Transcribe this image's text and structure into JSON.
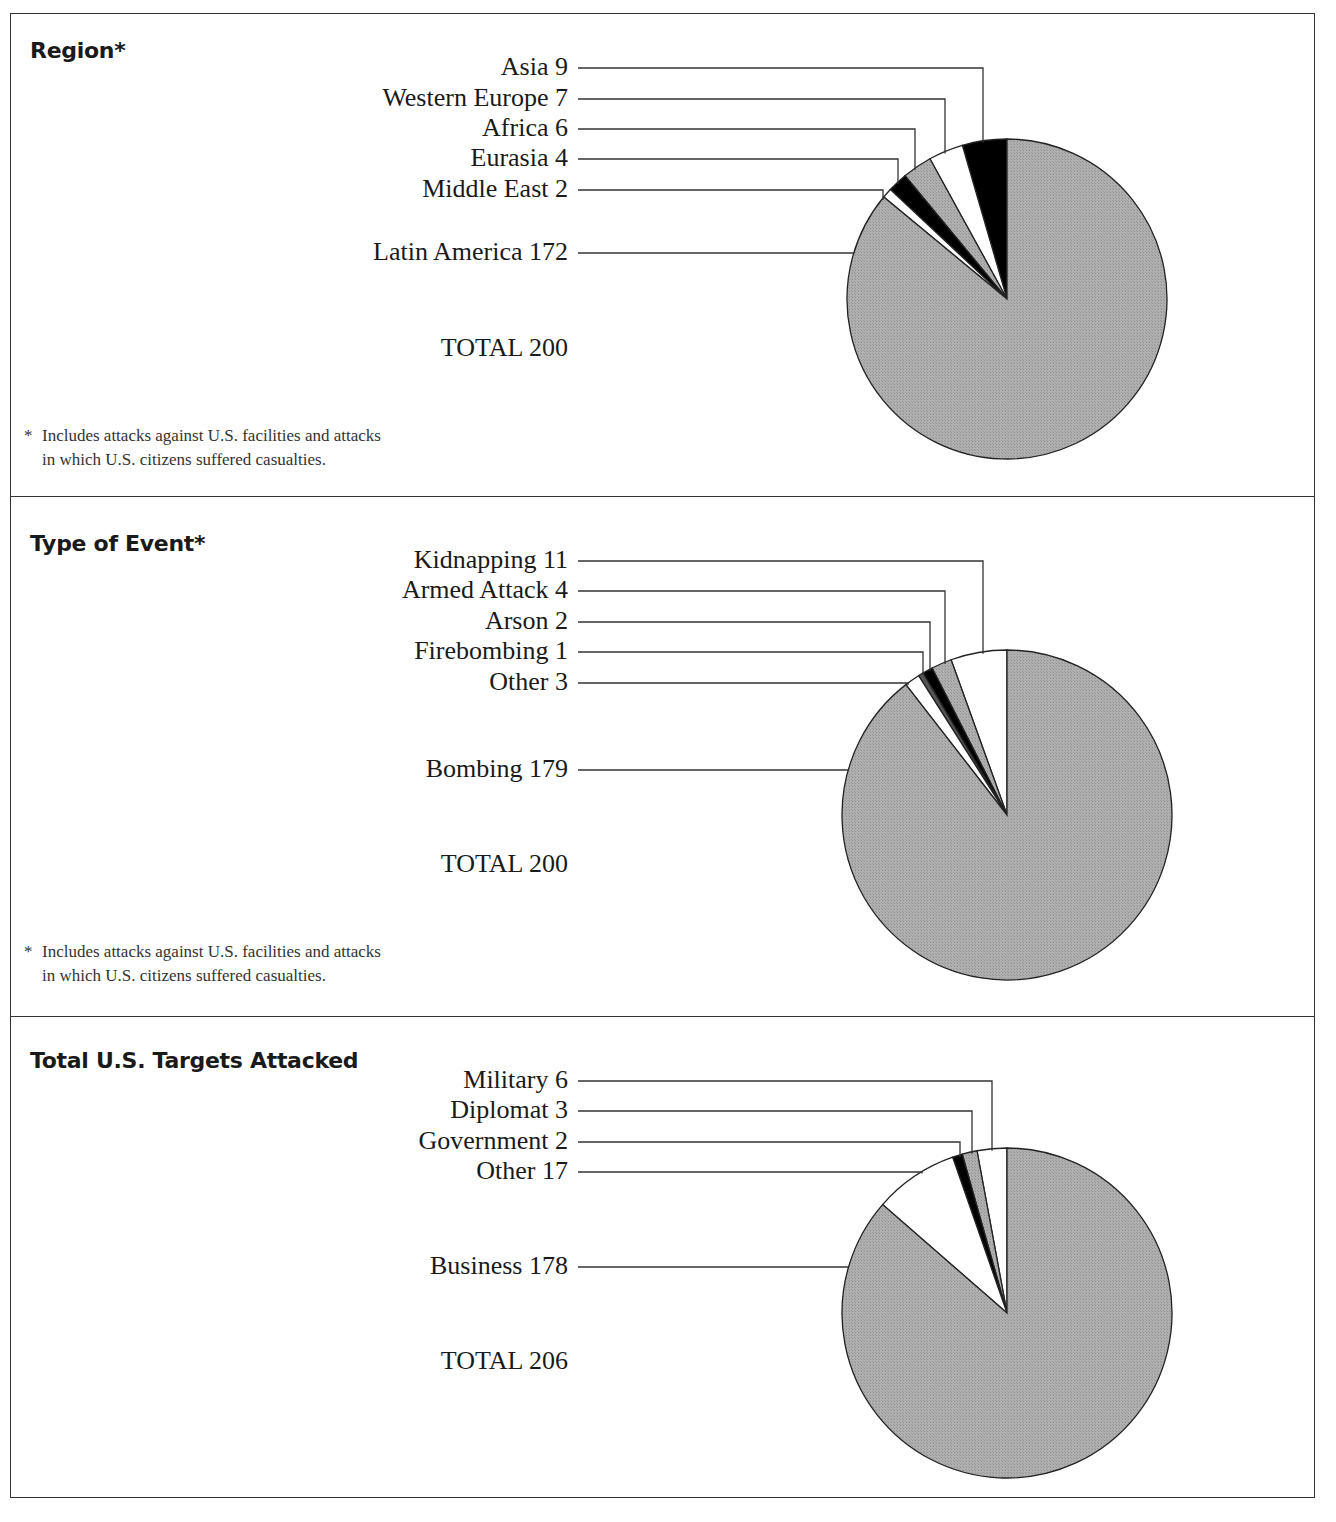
{
  "chart_data": [
    {
      "type": "pie",
      "title": "Region*",
      "slices": [
        {
          "label": "Asia",
          "value": 9,
          "fill": "#000000"
        },
        {
          "label": "Western Europe",
          "value": 7,
          "fill": "#ffffff"
        },
        {
          "label": "Africa",
          "value": 6,
          "fill": "#a9a9a9"
        },
        {
          "label": "Eurasia",
          "value": 4,
          "fill": "#000000"
        },
        {
          "label": "Middle East",
          "value": 2,
          "fill": "#ffffff"
        },
        {
          "label": "Latin America",
          "value": 172,
          "fill": "#a9a9a9"
        }
      ],
      "total_label": "TOTAL",
      "total": 200,
      "footnote": "Includes attacks against U.S. facilities and attacks in which U.S. citizens suffered casualties."
    },
    {
      "type": "pie",
      "title": "Type of Event*",
      "slices": [
        {
          "label": "Kidnapping",
          "value": 11,
          "fill": "#ffffff"
        },
        {
          "label": "Armed Attack",
          "value": 4,
          "fill": "#a9a9a9"
        },
        {
          "label": "Arson",
          "value": 2,
          "fill": "#000000"
        },
        {
          "label": "Firebombing",
          "value": 1,
          "fill": "#555555"
        },
        {
          "label": "Other",
          "value": 3,
          "fill": "#ffffff"
        },
        {
          "label": "Bombing",
          "value": 179,
          "fill": "#a9a9a9"
        }
      ],
      "total_label": "TOTAL",
      "total": 200,
      "footnote": "Includes attacks against U.S. facilities and attacks in which U.S. citizens suffered casualties."
    },
    {
      "type": "pie",
      "title": "Total U.S. Targets Attacked",
      "slices": [
        {
          "label": "Military",
          "value": 6,
          "fill": "#ffffff"
        },
        {
          "label": "Diplomat",
          "value": 3,
          "fill": "#a9a9a9"
        },
        {
          "label": "Government",
          "value": 2,
          "fill": "#000000"
        },
        {
          "label": "Other",
          "value": 17,
          "fill": "#ffffff"
        },
        {
          "label": "Business",
          "value": 178,
          "fill": "#a9a9a9"
        }
      ],
      "total_label": "TOTAL",
      "total": 206
    }
  ],
  "panels": [
    {
      "title": "Region",
      "asterisk": "*",
      "labels": [
        "Asia  9",
        "Western Europe  7",
        "Africa  6",
        "Eurasia  4",
        "Middle East  2",
        "Latin America  172"
      ],
      "total": "TOTAL  200",
      "footnote_star": "*",
      "footnote_line1": "Includes attacks against U.S. facilities and attacks",
      "footnote_line2": "in which U.S. citizens suffered casualties."
    },
    {
      "title": "Type of Event",
      "asterisk": "*",
      "labels": [
        "Kidnapping  11",
        "Armed Attack  4",
        "Arson  2",
        "Firebombing  1",
        "Other  3",
        "Bombing  179"
      ],
      "total": "TOTAL  200",
      "footnote_star": "*",
      "footnote_line1": "Includes attacks against U.S. facilities and attacks",
      "footnote_line2": "in which U.S. citizens suffered casualties."
    },
    {
      "title": "Total U.S. Targets Attacked",
      "labels": [
        "Military  6",
        "Diplomat  3",
        "Government  2",
        "Other  17",
        "Business  178"
      ],
      "total": "TOTAL  206"
    }
  ]
}
